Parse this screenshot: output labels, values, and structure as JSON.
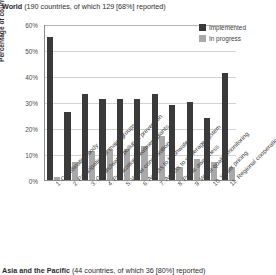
{
  "header": {
    "region": "World",
    "detail": " (190 countries, of which 129 [68%] reported)"
  },
  "next_section": {
    "region": "Asia and the Pacific",
    "detail": " (44 countries, of which 36 [80%] reported)"
  },
  "legend": {
    "position": "top-right",
    "entries": [
      {
        "label": "Implemented",
        "color": "#3a3a3a"
      },
      {
        "label": "In progress",
        "color": "#a9a9a9"
      }
    ]
  },
  "axis": {
    "ylabel": "Percentage of countries",
    "yticks": [
      "0%",
      "10%",
      "20%",
      "30%",
      "40%",
      "50%",
      "60%"
    ]
  },
  "chart_data": {
    "type": "bar",
    "title": "World (190 countries, of which 129 [68%] reported)",
    "xlabel": "",
    "ylabel": "Percentage of countries",
    "ylim": [
      0,
      60
    ],
    "ytick_values": [
      0,
      10,
      20,
      30,
      40,
      50,
      60
    ],
    "grid": true,
    "legend_position": "top-right",
    "categories": [
      "1. Coordinating body",
      "2. Participation of major groups",
      "3. Groundwater pollution prevention",
      "4. Purification treatment plants",
      "5. Water conservation",
      "6. Access to freshwater",
      "7. Access to sewerage system",
      "8. Public awareness",
      "9. Water quality monitoring",
      "10. Water pricing",
      "11. Regional cooperation"
    ],
    "series": [
      {
        "name": "Implemented",
        "color": "#3a3a3a",
        "values": [
          55,
          26,
          33,
          31,
          31,
          31,
          33,
          29,
          30,
          24,
          41
        ]
      },
      {
        "name": "In progress",
        "color": "#a9a9a9",
        "values": [
          1,
          7,
          11,
          12,
          12,
          13,
          17,
          5,
          8,
          7,
          5
        ]
      }
    ]
  }
}
